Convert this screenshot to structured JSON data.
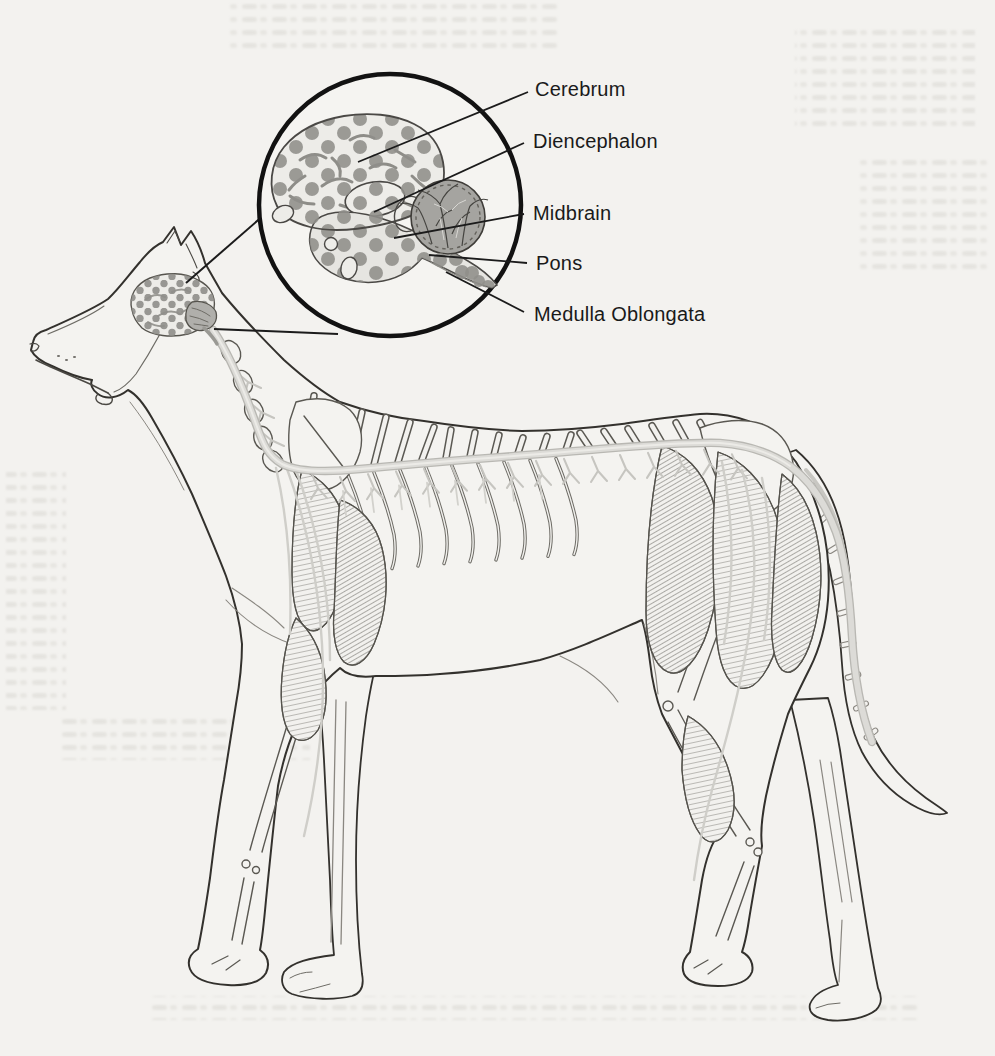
{
  "figure": {
    "labels": [
      {
        "id": "cerebrum",
        "text": "Cerebrum"
      },
      {
        "id": "diencephalon",
        "text": "Diencephalon"
      },
      {
        "id": "midbrain",
        "text": "Midbrain"
      },
      {
        "id": "pons",
        "text": "Pons"
      },
      {
        "id": "medulla-oblongata",
        "text": "Medulla Oblongata"
      }
    ],
    "colors": {
      "page_background": "#f3f2ef",
      "ink": "#33312d",
      "label_text": "#1a1a1a",
      "inset_circle": "#121212",
      "brain_dot": "#8f8e8a",
      "brain_fill": "#edece8",
      "cerebellum_fill": "#a5a4a0",
      "spinal_cord": "#dcdbd7",
      "nerve": "#c8c7c2"
    }
  }
}
